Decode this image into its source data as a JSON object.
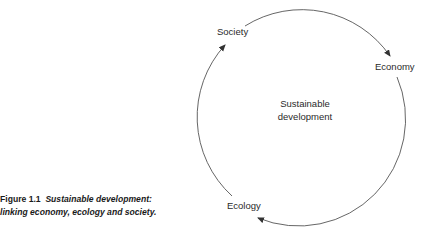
{
  "caption": {
    "label": "Figure 1.1",
    "title_line1": "Sustainable development:",
    "title_line2": "linking economy, ecology and society."
  },
  "diagram": {
    "center": {
      "line1": "Sustainable",
      "line2": "development"
    },
    "nodes": [
      {
        "id": "society",
        "label": "Society"
      },
      {
        "id": "economy",
        "label": "Economy"
      },
      {
        "id": "ecology",
        "label": "Ecology"
      }
    ],
    "cycle_direction": "clockwise",
    "arrows": [
      {
        "from": "Society",
        "to": "Economy"
      },
      {
        "from": "Economy",
        "to": "Ecology"
      },
      {
        "from": "Ecology",
        "to": "Society"
      }
    ],
    "colors": {
      "line": "#555555",
      "text": "#2a2a2a"
    }
  }
}
